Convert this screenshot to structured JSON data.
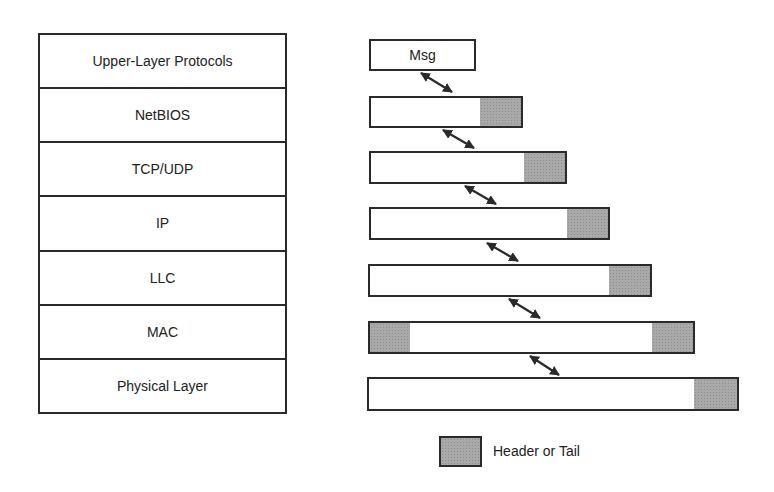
{
  "layers": [
    {
      "label": "Upper-Layer Protocols"
    },
    {
      "label": "NetBIOS"
    },
    {
      "label": "TCP/UDP"
    },
    {
      "label": "IP"
    },
    {
      "label": "LLC"
    },
    {
      "label": "MAC"
    },
    {
      "label": "Physical Layer"
    }
  ],
  "frames": [
    {
      "layer": "Upper-Layer Protocols",
      "label": "Msg",
      "header": false,
      "tail": false
    },
    {
      "layer": "NetBIOS",
      "header": false,
      "tail": true
    },
    {
      "layer": "TCP/UDP",
      "header": false,
      "tail": true
    },
    {
      "layer": "IP",
      "header": false,
      "tail": true
    },
    {
      "layer": "LLC",
      "header": false,
      "tail": true
    },
    {
      "layer": "MAC",
      "header": true,
      "tail": true
    },
    {
      "layer": "Physical Layer",
      "header": false,
      "tail": true
    }
  ],
  "legend": {
    "label": "Header or Tail",
    "swatch_color": "#a9a9a9"
  },
  "colors": {
    "line": "#2a2a2a",
    "shade": "#a9a9a9",
    "background": "#ffffff"
  }
}
